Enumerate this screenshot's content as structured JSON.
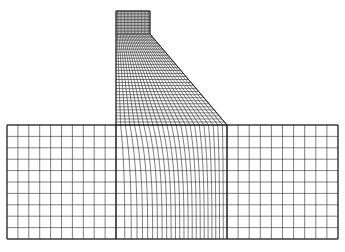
{
  "figure": {
    "type": "finite-element-mesh",
    "colors": {
      "background": "#ffffff",
      "line": "#2a2a2a",
      "outline": "#1a1a1a"
    },
    "stroke_width": 0.6,
    "outline_width": 1.0
  },
  "dam": {
    "crest": {
      "x_left": 116,
      "x_right": 150,
      "y_top": 11,
      "y_bottom": 34,
      "rows": 8
    },
    "body": {
      "x_left": 116,
      "x_neck": 150,
      "y_top": 34,
      "x_toe": 227,
      "y_base": 125,
      "rows": 30,
      "cols": 24
    }
  },
  "foundation": {
    "x_left": 7,
    "x_right": 338,
    "y_top": 125,
    "y_bottom": 239,
    "rows": 10,
    "left_block": {
      "x0": 7,
      "x1": 116,
      "cols": 10
    },
    "middle_block": {
      "x0": 116,
      "x1": 227,
      "cols": 24,
      "curve_depth": 0.55
    },
    "right_block": {
      "x0": 227,
      "x1": 338,
      "cols": 10
    }
  }
}
